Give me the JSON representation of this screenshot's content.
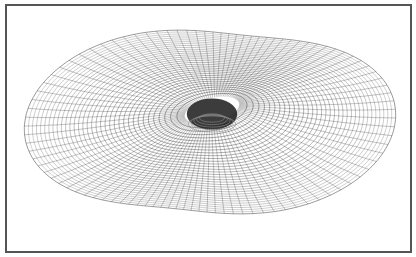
{
  "figure": {
    "caption": "",
    "frame_color": "#555555",
    "line_color": "#222222",
    "background": "#ffffff",
    "mesh": {
      "center": [
        210,
        122
      ],
      "rings": 34,
      "meridians": 96,
      "outer_radius_x": 158,
      "outer_radius_y": 108,
      "lobe_strength": 0.22,
      "tilt_deg": 28,
      "hole_center": [
        212,
        120
      ],
      "hole_radius": [
        28,
        12
      ]
    }
  }
}
